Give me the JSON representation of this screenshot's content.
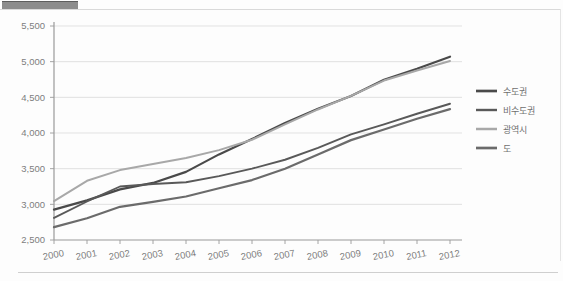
{
  "figure": {
    "header_block_name": "title-bar-redacted",
    "background": "#fdfdfd"
  },
  "chart_data": {
    "type": "line",
    "title": "",
    "subtitle": "",
    "xlabel": "",
    "ylabel": "",
    "categories": [
      "2000",
      "2001",
      "2002",
      "2003",
      "2004",
      "2005",
      "2006",
      "2007",
      "2008",
      "2009",
      "2010",
      "2011",
      "2012"
    ],
    "x": [
      2000,
      2001,
      2002,
      2003,
      2004,
      2005,
      2006,
      2007,
      2008,
      2009,
      2010,
      2011,
      2012
    ],
    "ylim": [
      2500,
      5500
    ],
    "yticks": [
      2500,
      3000,
      3500,
      4000,
      4500,
      5000,
      5500
    ],
    "ytick_labels": [
      "2,500",
      "3,000",
      "3,500",
      "4,000",
      "4,500",
      "5,000",
      "5,500"
    ],
    "grid": true,
    "grid_axis": "y",
    "legend_position": "right",
    "series": [
      {
        "name": "수도권",
        "color": "#4a4a4a",
        "width": 2.2,
        "values": [
          2925,
          3055,
          3210,
          3300,
          3455,
          3700,
          3915,
          4140,
          4340,
          4520,
          4745,
          4900,
          5070
        ]
      },
      {
        "name": "비수도권",
        "color": "#595959",
        "width": 1.9,
        "values": [
          2810,
          3040,
          3250,
          3285,
          3310,
          3395,
          3500,
          3625,
          3790,
          3980,
          4120,
          4270,
          4410
        ]
      },
      {
        "name": "광역시",
        "color": "#a8a8a8",
        "width": 2.0,
        "values": [
          3045,
          3330,
          3480,
          3565,
          3650,
          3760,
          3905,
          4120,
          4330,
          4520,
          4735,
          4875,
          5010
        ]
      },
      {
        "name": "도",
        "color": "#6b6b6b",
        "width": 2.2,
        "values": [
          2680,
          2805,
          2965,
          3035,
          3110,
          3225,
          3340,
          3500,
          3700,
          3900,
          4050,
          4200,
          4335
        ]
      }
    ]
  }
}
